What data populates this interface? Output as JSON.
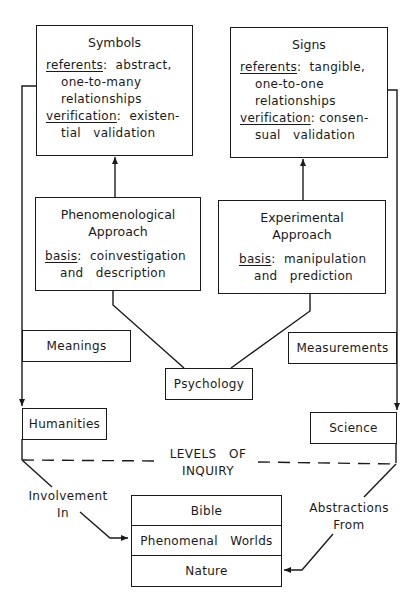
{
  "diagram": {
    "symbols": {
      "title": "Symbols",
      "referents_label": "referents",
      "referents_sep": ":",
      "referents_value": "abstract,",
      "referents_line2": "one-to-many",
      "referents_line3": "relationships",
      "verification_label": "verification",
      "verification_sep": ":",
      "verification_value": "existen-",
      "verification_line2": "tial   validation"
    },
    "signs": {
      "title": "Signs",
      "referents_label": "referents",
      "referents_sep": ":",
      "referents_value": "tangible,",
      "referents_line2": "one-to-one",
      "referents_line3": "relationships",
      "verification_label": "verification",
      "verification_sep": ":",
      "verification_value": "consen-",
      "verification_line2": "sual   validation"
    },
    "phenomenological": {
      "title_line1": "Phenomenological",
      "title_line2": "Approach",
      "basis_label": "basis",
      "basis_sep": ":",
      "basis_value": "coinvestigation",
      "basis_line2": "and   description"
    },
    "experimental": {
      "title_line1": "Experimental",
      "title_line2": "Approach",
      "basis_label": "basis",
      "basis_sep": ":",
      "basis_value": "manipulation",
      "basis_line2": "and   prediction"
    },
    "meanings": "Meanings",
    "measurements": "Measurements",
    "psychology": "Psychology",
    "humanities": "Humanities",
    "science": "Science",
    "levels_line1": "LEVELS   OF",
    "levels_line2": "INQUIRY",
    "involvement_line1": "Involvement",
    "involvement_line2": "In",
    "abstractions_line1": "Abstractions",
    "abstractions_line2": "From",
    "stack": [
      "Bible",
      "Phenomenal   Worlds",
      "Nature"
    ]
  },
  "colors": {
    "ink": "#1a1a1a",
    "paper": "#ffffff"
  }
}
